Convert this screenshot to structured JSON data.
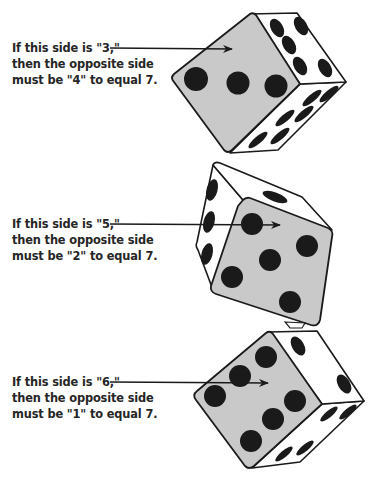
{
  "figure": {
    "colors": {
      "ink": "#1a1a1a",
      "front_face": "#c9c9c9",
      "side_face": "#ffffff",
      "background": "#ffffff"
    },
    "examples": [
      {
        "shown_value": "3",
        "opposite_value": "4",
        "lines": [
          "If this side is \"3,\"",
          "then the opposite side",
          "must be \"4\" to equal 7."
        ]
      },
      {
        "shown_value": "5",
        "opposite_value": "2",
        "lines": [
          "If this side is \"5,\"",
          "then the opposite side",
          "must be \"2\" to equal 7."
        ]
      },
      {
        "shown_value": "6",
        "opposite_value": "1",
        "lines": [
          "If this side is \"6,\"",
          "then the opposite side",
          "must be \"1\" to equal 7."
        ]
      }
    ],
    "total": 7
  }
}
